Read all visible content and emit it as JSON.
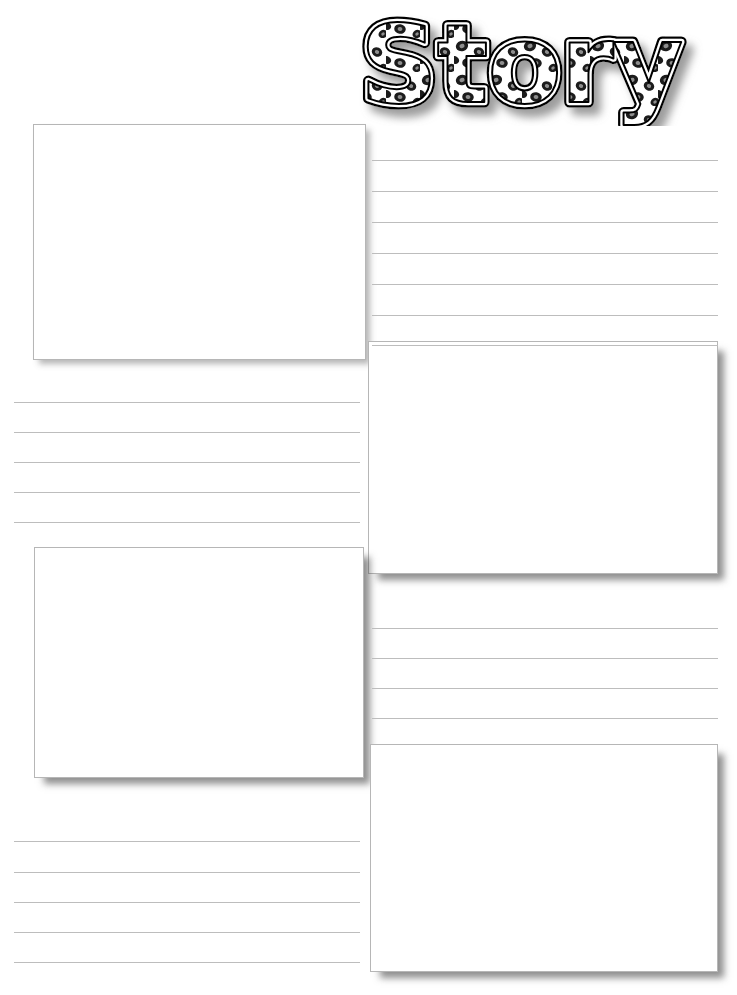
{
  "page": {
    "title": "Story",
    "background_color": "#ffffff",
    "width": 737,
    "height": 995
  },
  "header": {
    "title_text": "Story",
    "title_style": "leopard-print-filled-outline",
    "title_fill_pattern": "leopard-spots",
    "title_outline_color": "#000000",
    "title_spot_color": "#1c1c1c",
    "title_spot_inner_color": "#8a8a8a",
    "title_shadow_color": "#9a9a9a",
    "title_align": "right"
  },
  "colors": {
    "rule_line": "#bdbdbd",
    "box_border": "#b6b6b6",
    "box_fill": "#ffffff",
    "shadow": "#5a5a5a",
    "page_background": "#ffffff"
  },
  "boxes": [
    {
      "name": "picture-box-1",
      "label": "",
      "x": 33,
      "y": 124,
      "width": 333,
      "height": 236,
      "shadow": "soft"
    },
    {
      "name": "picture-box-2",
      "label": "",
      "x": 368,
      "y": 341,
      "width": 350,
      "height": 233,
      "shadow": "strong"
    },
    {
      "name": "picture-box-3",
      "label": "",
      "x": 34,
      "y": 547,
      "width": 330,
      "height": 231,
      "shadow": "strong"
    },
    {
      "name": "picture-box-4",
      "label": "",
      "x": 370,
      "y": 744,
      "width": 348,
      "height": 228,
      "shadow": "strong"
    }
  ],
  "line_groups": [
    {
      "name": "writing-lines-right-top",
      "x": 372,
      "y": 150,
      "width": 346,
      "line_count": 7,
      "line_spacing": 31,
      "line_offsets": [
        10,
        41,
        72,
        103,
        134,
        165,
        195
      ]
    },
    {
      "name": "writing-lines-left-middle",
      "x": 14,
      "y": 392,
      "width": 346,
      "line_count": 5,
      "line_spacing": 30,
      "line_offsets": [
        10,
        40,
        70,
        100,
        130
      ]
    },
    {
      "name": "writing-lines-right-middle",
      "x": 372,
      "y": 618,
      "width": 346,
      "line_count": 4,
      "line_spacing": 30,
      "line_offsets": [
        10,
        40,
        70,
        100
      ]
    },
    {
      "name": "writing-lines-left-bottom",
      "x": 14,
      "y": 831,
      "width": 346,
      "line_count": 5,
      "line_spacing": 30,
      "line_offsets": [
        10,
        41,
        71,
        101,
        131
      ]
    }
  ]
}
